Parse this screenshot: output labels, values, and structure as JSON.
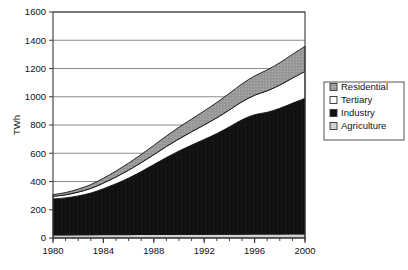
{
  "chart_data": {
    "type": "area",
    "stacked": true,
    "title": "",
    "subtitle": "",
    "xlabel": "",
    "ylabel": "TWh",
    "xlim": [
      1980,
      2000
    ],
    "ylim": [
      0,
      1600
    ],
    "ytick_step": 200,
    "grid": true,
    "grid_axis": "y",
    "legend_position": "right",
    "x": [
      1980,
      1981,
      1982,
      1983,
      1984,
      1985,
      1986,
      1987,
      1988,
      1989,
      1990,
      1991,
      1992,
      1993,
      1994,
      1995,
      1996,
      1997,
      1998,
      1999,
      2000
    ],
    "xtick_labels": [
      "1980",
      "1984",
      "1988",
      "1992",
      "1996",
      "2000"
    ],
    "xtick_values": [
      1980,
      1984,
      1988,
      1992,
      1996,
      2000
    ],
    "ytick_labels": [
      "0",
      "200",
      "400",
      "600",
      "800",
      "1000",
      "1200",
      "1400",
      "1600"
    ],
    "ytick_values": [
      0,
      200,
      400,
      600,
      800,
      1000,
      1200,
      1400,
      1600
    ],
    "stack_order_bottom_to_top": [
      "Agriculture",
      "Industry",
      "Tertiary",
      "Residential"
    ],
    "series": [
      {
        "name": "Agriculture",
        "color": "#d0d0d0",
        "pattern": "light-texture",
        "values": [
          22,
          22,
          23,
          23,
          24,
          24,
          24,
          25,
          25,
          25,
          26,
          26,
          26,
          27,
          27,
          27,
          28,
          28,
          28,
          29,
          29
        ]
      },
      {
        "name": "Industry",
        "color": "#111111",
        "pattern": "solid",
        "values": [
          255,
          262,
          275,
          295,
          325,
          360,
          400,
          445,
          495,
          545,
          590,
          632,
          672,
          712,
          760,
          810,
          845,
          862,
          890,
          925,
          960
        ]
      },
      {
        "name": "Tertiary",
        "color": "#ffffff",
        "pattern": "empty",
        "values": [
          18,
          22,
          27,
          33,
          40,
          48,
          56,
          63,
          70,
          78,
          86,
          94,
          103,
          112,
          120,
          128,
          138,
          152,
          165,
          178,
          190
        ]
      },
      {
        "name": "Residential",
        "color": "#9a9a9a",
        "pattern": "dot-texture",
        "values": [
          12,
          16,
          21,
          27,
          34,
          42,
          50,
          58,
          66,
          74,
          82,
          90,
          99,
          108,
          117,
          126,
          136,
          148,
          158,
          168,
          178
        ]
      }
    ],
    "totals": [
      307,
      322,
      346,
      378,
      423,
      474,
      530,
      591,
      656,
      722,
      784,
      842,
      900,
      959,
      1024,
      1091,
      1147,
      1190,
      1241,
      1300,
      1357
    ],
    "legend_entries": [
      {
        "label": "Residential",
        "swatch": "dot-texture"
      },
      {
        "label": "Tertiary",
        "swatch": "empty"
      },
      {
        "label": "Industry",
        "swatch": "solid-black"
      },
      {
        "label": "Agriculture",
        "swatch": "light-texture"
      }
    ]
  },
  "legend": {
    "items": [
      {
        "label": "Residential"
      },
      {
        "label": "Tertiary"
      },
      {
        "label": "Industry"
      },
      {
        "label": "Agriculture"
      }
    ]
  },
  "axes": {
    "y_title": "TWh"
  }
}
